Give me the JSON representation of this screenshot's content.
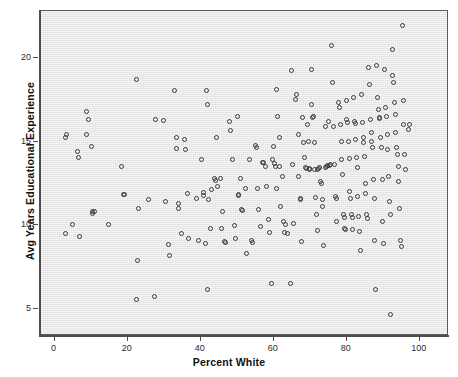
{
  "chart_data": {
    "type": "scatter",
    "title": "",
    "xlabel": "Percent White",
    "ylabel": "Avg Years Educational Experience",
    "xlim": [
      -4,
      108
    ],
    "ylim": [
      3.4,
      22.8
    ],
    "xticks": [
      0,
      20,
      40,
      60,
      80,
      100
    ],
    "yticks": [
      5,
      10,
      15,
      20
    ],
    "grid": false,
    "legend": null,
    "marker": "open-circle",
    "marker_color": "#3a3a3a",
    "plot_background": "#e9e9e9",
    "n_points": 241,
    "points": [
      [
        3.0,
        15.2
      ],
      [
        3.4,
        15.4
      ],
      [
        3.2,
        9.5
      ],
      [
        5.0,
        10.0
      ],
      [
        6.5,
        14.4
      ],
      [
        6.8,
        14.0
      ],
      [
        6.9,
        9.3
      ],
      [
        8.8,
        16.8
      ],
      [
        9.0,
        15.4
      ],
      [
        9.4,
        16.3
      ],
      [
        10.2,
        14.7
      ],
      [
        10.4,
        10.8
      ],
      [
        10.6,
        10.7
      ],
      [
        11.0,
        10.8
      ],
      [
        14.8,
        10.0
      ],
      [
        18.4,
        13.5
      ],
      [
        18.9,
        11.8
      ],
      [
        19.2,
        11.8
      ],
      [
        22.5,
        18.7
      ],
      [
        22.6,
        5.55
      ],
      [
        23.0,
        11.0
      ],
      [
        22.8,
        7.85
      ],
      [
        25.8,
        11.5
      ],
      [
        27.4,
        5.7
      ],
      [
        27.8,
        16.3
      ],
      [
        29.9,
        16.25
      ],
      [
        30.5,
        11.4
      ],
      [
        31.3,
        8.85
      ],
      [
        31.5,
        8.2
      ],
      [
        33.0,
        18.0
      ],
      [
        33.4,
        15.2
      ],
      [
        33.6,
        14.55
      ],
      [
        34.0,
        11.3
      ],
      [
        34.2,
        11.0
      ],
      [
        35.0,
        9.5
      ],
      [
        35.8,
        15.1
      ],
      [
        36.0,
        14.5
      ],
      [
        36.4,
        11.9
      ],
      [
        36.8,
        9.2
      ],
      [
        38.9,
        11.55
      ],
      [
        39.5,
        9.1
      ],
      [
        40.3,
        13.9
      ],
      [
        40.8,
        11.95
      ],
      [
        41.0,
        11.75
      ],
      [
        41.5,
        8.9
      ],
      [
        41.8,
        18.0
      ],
      [
        41.9,
        17.2
      ],
      [
        42.0,
        6.15
      ],
      [
        42.4,
        11.5
      ],
      [
        42.8,
        9.8
      ],
      [
        43.2,
        12.1
      ],
      [
        44.0,
        12.8
      ],
      [
        44.2,
        12.65
      ],
      [
        44.5,
        15.2
      ],
      [
        44.8,
        12.3
      ],
      [
        45.6,
        12.8
      ],
      [
        45.8,
        9.8
      ],
      [
        46.2,
        10.8
      ],
      [
        46.6,
        9.0
      ],
      [
        46.8,
        8.95
      ],
      [
        48.0,
        16.2
      ],
      [
        48.4,
        15.65
      ],
      [
        48.8,
        13.9
      ],
      [
        49.3,
        9.95
      ],
      [
        49.6,
        9.2
      ],
      [
        50.2,
        16.5
      ],
      [
        50.4,
        11.8
      ],
      [
        50.6,
        11.75
      ],
      [
        51.0,
        12.8
      ],
      [
        51.4,
        10.9
      ],
      [
        51.6,
        10.85
      ],
      [
        52.4,
        12.2
      ],
      [
        52.8,
        8.3
      ],
      [
        53.6,
        13.9
      ],
      [
        54.0,
        9.1
      ],
      [
        54.2,
        8.95
      ],
      [
        55.2,
        14.75
      ],
      [
        55.4,
        14.6
      ],
      [
        55.8,
        12.2
      ],
      [
        56.0,
        10.9
      ],
      [
        56.4,
        9.9
      ],
      [
        57.0,
        13.7
      ],
      [
        57.4,
        13.75
      ],
      [
        57.8,
        13.5
      ],
      [
        58.2,
        12.3
      ],
      [
        58.6,
        10.3
      ],
      [
        59.0,
        9.55
      ],
      [
        59.4,
        6.5
      ],
      [
        59.8,
        13.9
      ],
      [
        60.0,
        14.7
      ],
      [
        60.4,
        13.65
      ],
      [
        60.6,
        13.5
      ],
      [
        60.8,
        12.2
      ],
      [
        61.0,
        18.1
      ],
      [
        61.2,
        16.5
      ],
      [
        61.6,
        15.2
      ],
      [
        61.8,
        13.5
      ],
      [
        62.0,
        11.1
      ],
      [
        62.6,
        12.9
      ],
      [
        62.8,
        10.2
      ],
      [
        63.0,
        9.55
      ],
      [
        63.4,
        10.05
      ],
      [
        63.8,
        9.5
      ],
      [
        64.6,
        6.5
      ],
      [
        65.0,
        19.2
      ],
      [
        65.2,
        13.6
      ],
      [
        65.6,
        10.1
      ],
      [
        66.2,
        17.5
      ],
      [
        66.4,
        17.8
      ],
      [
        66.8,
        15.4
      ],
      [
        67.0,
        12.9
      ],
      [
        67.4,
        11.55
      ],
      [
        67.6,
        11.5
      ],
      [
        67.8,
        9.0
      ],
      [
        68.0,
        16.4
      ],
      [
        68.4,
        14.95
      ],
      [
        68.6,
        14.0
      ],
      [
        68.8,
        13.4
      ],
      [
        69.0,
        13.35
      ],
      [
        69.4,
        16.0
      ],
      [
        69.6,
        15.0
      ],
      [
        69.8,
        13.35
      ],
      [
        70.0,
        13.3
      ],
      [
        70.4,
        19.3
      ],
      [
        70.6,
        17.2
      ],
      [
        70.8,
        16.4
      ],
      [
        71.0,
        16.45
      ],
      [
        71.2,
        14.9
      ],
      [
        71.4,
        13.3
      ],
      [
        71.6,
        11.65
      ],
      [
        71.8,
        10.6
      ],
      [
        72.0,
        9.65
      ],
      [
        72.2,
        13.3
      ],
      [
        72.4,
        13.35
      ],
      [
        72.8,
        13.4
      ],
      [
        73.0,
        12.6
      ],
      [
        73.2,
        12.5
      ],
      [
        73.4,
        11.5
      ],
      [
        73.6,
        11.1
      ],
      [
        73.8,
        8.75
      ],
      [
        74.2,
        15.9
      ],
      [
        74.4,
        13.45
      ],
      [
        74.6,
        13.5
      ],
      [
        74.8,
        13.55
      ],
      [
        75.2,
        16.2
      ],
      [
        75.4,
        13.55
      ],
      [
        75.8,
        13.6
      ],
      [
        76.0,
        20.7
      ],
      [
        76.2,
        18.5
      ],
      [
        76.6,
        15.9
      ],
      [
        76.8,
        13.6
      ],
      [
        77.0,
        11.7
      ],
      [
        77.2,
        11.6
      ],
      [
        77.4,
        10.2
      ],
      [
        78.0,
        17.3
      ],
      [
        78.2,
        17.0
      ],
      [
        78.4,
        16.0
      ],
      [
        78.6,
        15.0
      ],
      [
        78.8,
        13.9
      ],
      [
        79.0,
        13.0
      ],
      [
        79.2,
        10.6
      ],
      [
        79.4,
        10.45
      ],
      [
        79.6,
        9.8
      ],
      [
        79.8,
        9.7
      ],
      [
        80.0,
        17.4
      ],
      [
        80.2,
        16.3
      ],
      [
        80.4,
        16.1
      ],
      [
        80.6,
        15.0
      ],
      [
        80.8,
        13.95
      ],
      [
        81.0,
        12.0
      ],
      [
        81.2,
        11.6
      ],
      [
        81.4,
        10.6
      ],
      [
        81.6,
        10.45
      ],
      [
        81.8,
        9.75
      ],
      [
        82.0,
        17.6
      ],
      [
        82.2,
        16.2
      ],
      [
        82.4,
        16.05
      ],
      [
        82.6,
        15.1
      ],
      [
        82.8,
        14.0
      ],
      [
        83.0,
        13.4
      ],
      [
        83.2,
        11.7
      ],
      [
        83.4,
        10.5
      ],
      [
        83.6,
        9.6
      ],
      [
        83.8,
        8.5
      ],
      [
        84.2,
        17.8
      ],
      [
        84.4,
        16.1
      ],
      [
        84.6,
        15.2
      ],
      [
        84.8,
        14.9
      ],
      [
        85.0,
        14.1
      ],
      [
        85.2,
        12.5
      ],
      [
        85.4,
        11.9
      ],
      [
        85.6,
        10.6
      ],
      [
        85.8,
        10.4
      ],
      [
        86.2,
        19.4
      ],
      [
        86.4,
        18.4
      ],
      [
        86.6,
        16.3
      ],
      [
        86.8,
        15.5
      ],
      [
        87.0,
        15.0
      ],
      [
        87.2,
        14.6
      ],
      [
        87.4,
        12.7
      ],
      [
        87.6,
        11.6
      ],
      [
        87.8,
        9.1
      ],
      [
        88.0,
        6.15
      ],
      [
        88.4,
        19.5
      ],
      [
        88.6,
        17.6
      ],
      [
        88.8,
        16.9
      ],
      [
        89.0,
        16.4
      ],
      [
        89.2,
        16.35
      ],
      [
        89.4,
        15.2
      ],
      [
        89.6,
        14.6
      ],
      [
        89.8,
        12.7
      ],
      [
        90.0,
        10.2
      ],
      [
        90.2,
        8.9
      ],
      [
        90.6,
        19.3
      ],
      [
        90.8,
        17.0
      ],
      [
        91.0,
        16.5
      ],
      [
        91.2,
        15.4
      ],
      [
        91.4,
        14.5
      ],
      [
        91.6,
        12.9
      ],
      [
        91.8,
        11.4
      ],
      [
        92.0,
        10.6
      ],
      [
        92.2,
        4.65
      ],
      [
        92.6,
        20.5
      ],
      [
        92.8,
        18.9
      ],
      [
        93.0,
        18.5
      ],
      [
        93.2,
        17.3
      ],
      [
        93.4,
        16.6
      ],
      [
        93.6,
        15.5
      ],
      [
        93.8,
        14.6
      ],
      [
        94.0,
        14.2
      ],
      [
        94.2,
        13.5
      ],
      [
        94.4,
        12.6
      ],
      [
        94.6,
        11.0
      ],
      [
        94.8,
        9.1
      ],
      [
        95.0,
        8.7
      ],
      [
        95.4,
        21.9
      ],
      [
        95.6,
        17.4
      ],
      [
        95.8,
        16.0
      ],
      [
        96.0,
        14.2
      ],
      [
        96.2,
        13.3
      ],
      [
        97.0,
        15.7
      ],
      [
        97.4,
        16.0
      ]
    ]
  },
  "axes": {
    "x": {
      "title": "Percent White",
      "tick_labels": [
        "0",
        "20",
        "40",
        "60",
        "80",
        "100"
      ]
    },
    "y": {
      "title": "Avg Years Educational Experience",
      "tick_labels": [
        "5",
        "10",
        "15",
        "20"
      ]
    }
  }
}
